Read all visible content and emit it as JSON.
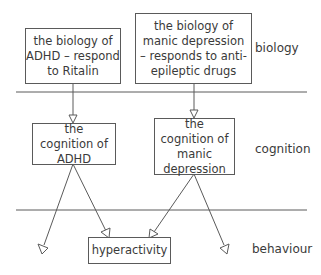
{
  "levels": {
    "biology": "biology",
    "cognition": "cognition",
    "behaviour": "behaviour"
  },
  "boxes": {
    "biology_adhd": "the biology of ADHD – respond to Ritalin",
    "biology_manic": "the biology of manic depression – responds to anti-epileptic drugs",
    "cognition_adhd": "the cognition of ADHD",
    "cognition_manic": "the cognition of manic depression",
    "hyperactivity": "hyperactivity"
  },
  "colors": {
    "line": "#5a5a5a",
    "text": "#3a3a3a"
  }
}
